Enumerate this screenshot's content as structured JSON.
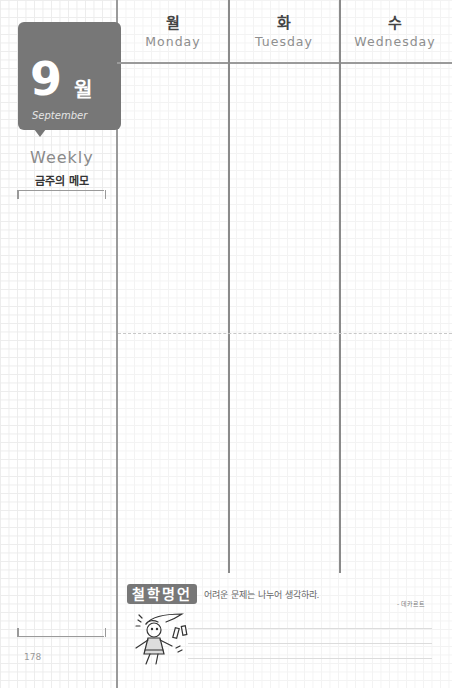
{
  "sidebar": {
    "month_number": "9",
    "month_korean": "월",
    "month_english": "September",
    "weekly_label": "Weekly",
    "memo_label": "금주의 메모",
    "page_number": "178"
  },
  "days": [
    {
      "korean": "월",
      "english": "Monday"
    },
    {
      "korean": "화",
      "english": "Tuesday"
    },
    {
      "korean": "수",
      "english": "Wednesday"
    }
  ],
  "quote": {
    "badge": "철학명언",
    "text": "어려운 문제는 나누어 생각하라.",
    "author": "- 데카르트",
    "illustration": "girl-illustration"
  },
  "colors": {
    "accent_gray": "#777777",
    "line_gray": "#9a9a9a",
    "grid": "#ececec"
  }
}
